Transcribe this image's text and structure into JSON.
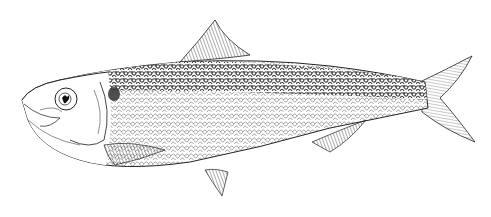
{
  "image": {
    "subject": "fish illustration",
    "style": "pen-and-ink engraving",
    "background_color": "#ffffff",
    "ink_color": "#1a1a1a",
    "orientation": "facing left"
  }
}
